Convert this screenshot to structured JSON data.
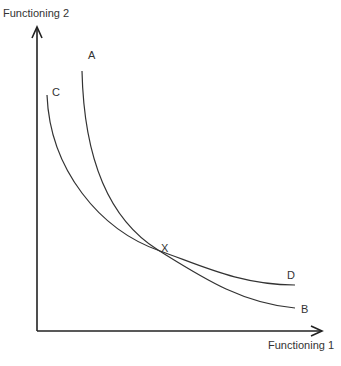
{
  "diagram": {
    "y_axis_label": "Functioning 2",
    "x_axis_label": "Functioning 1",
    "curve_labels": {
      "A": "A",
      "B": "B",
      "C": "C",
      "D": "D"
    },
    "intersection_label": "X",
    "colors": {
      "line": "#333333",
      "axis": "#222222",
      "text": "#333333",
      "background": "#ffffff"
    }
  }
}
